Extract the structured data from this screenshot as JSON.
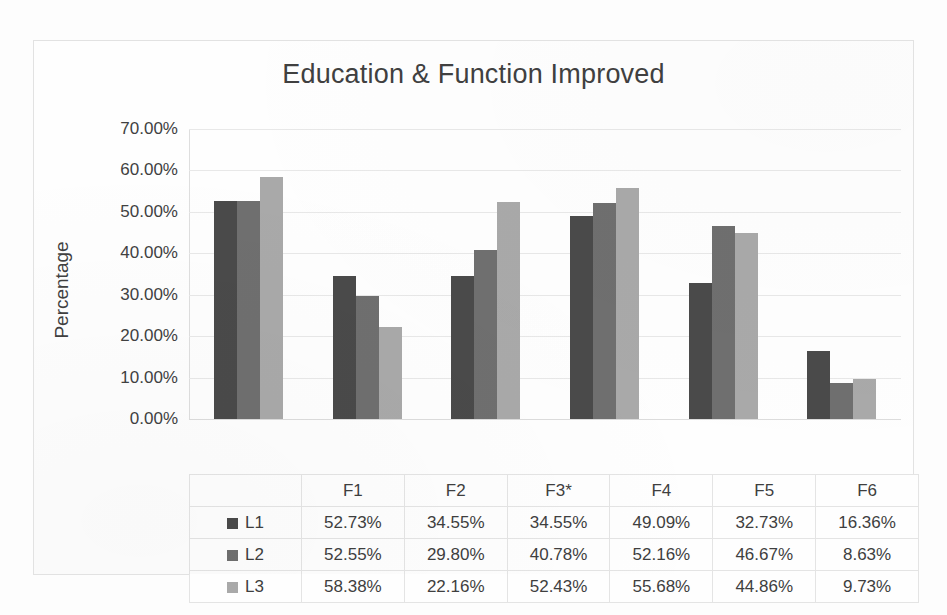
{
  "chart_data": {
    "type": "bar",
    "title": "Education & Function Improved",
    "xlabel": "",
    "ylabel": "Percentage",
    "ylim": [
      0,
      70
    ],
    "ytick_labels": [
      "0.00%",
      "10.00%",
      "20.00%",
      "30.00%",
      "40.00%",
      "50.00%",
      "60.00%",
      "70.00%"
    ],
    "ytick_values": [
      0,
      10,
      20,
      30,
      40,
      50,
      60,
      70
    ],
    "grid": true,
    "legend_position": "data-table",
    "categories": [
      "F1",
      "F2",
      "F3*",
      "F4",
      "F5",
      "F6"
    ],
    "series": [
      {
        "name": "L1",
        "color": "#4a4a4a",
        "values": [
          52.73,
          34.55,
          34.55,
          49.09,
          32.73,
          16.36
        ],
        "labels": [
          "52.73%",
          "34.55%",
          "34.55%",
          "49.09%",
          "32.73%",
          "16.36%"
        ]
      },
      {
        "name": "L2",
        "color": "#6f6f6f",
        "values": [
          52.55,
          29.8,
          40.78,
          52.16,
          46.67,
          8.63
        ],
        "labels": [
          "52.55%",
          "29.80%",
          "40.78%",
          "52.16%",
          "46.67%",
          "8.63%"
        ]
      },
      {
        "name": "L3",
        "color": "#a9a9a9",
        "values": [
          58.38,
          22.16,
          52.43,
          55.68,
          44.86,
          9.73
        ],
        "labels": [
          "58.38%",
          "22.16%",
          "52.43%",
          "55.68%",
          "44.86%",
          "9.73%"
        ]
      }
    ]
  },
  "data_table": {
    "column_headers": [
      "F1",
      "F2",
      "F3*",
      "F4",
      "F5",
      "F6"
    ],
    "rows": [
      {
        "label": "L1",
        "swatch_icon": "legend-swatch-dark",
        "values": [
          "52.73%",
          "34.55%",
          "34.55%",
          "49.09%",
          "32.73%",
          "16.36%"
        ]
      },
      {
        "label": "L2",
        "swatch_icon": "legend-swatch-medium",
        "values": [
          "52.55%",
          "29.80%",
          "40.78%",
          "52.16%",
          "46.67%",
          "8.63%"
        ]
      },
      {
        "label": "L3",
        "swatch_icon": "legend-swatch-light",
        "values": [
          "58.38%",
          "22.16%",
          "52.43%",
          "55.68%",
          "44.86%",
          "9.73%"
        ]
      }
    ]
  }
}
